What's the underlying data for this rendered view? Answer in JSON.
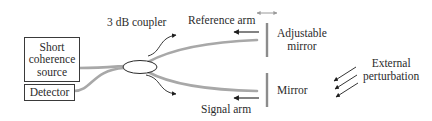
{
  "diagram": {
    "type": "fiber-optic Michelson interferometer",
    "components": {
      "source": {
        "label": "Short\ncoherence\nsource"
      },
      "detector": {
        "label": "Detector"
      },
      "coupler": {
        "label": "3 dB coupler"
      },
      "reference_arm": {
        "label": "Reference arm"
      },
      "signal_arm": {
        "label": "Signal arm"
      },
      "adjustable_mirror": {
        "label": "Adjustable\nmirror"
      },
      "mirror": {
        "label": "Mirror"
      },
      "perturbation": {
        "label": "External\nperturbation"
      }
    },
    "colors": {
      "fiber": "#a8a8a8",
      "mirror": "#8c8c8c",
      "line": "#2b2b2b",
      "double_arrow": "#9a9a9a"
    }
  }
}
